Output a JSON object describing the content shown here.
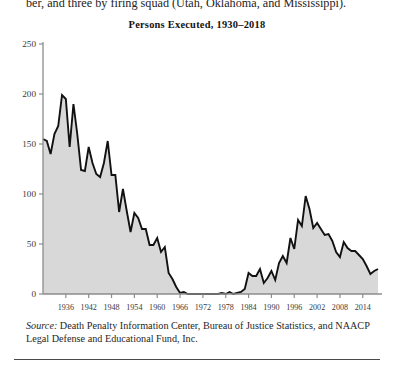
{
  "page": {
    "running_text": "ber, and three by firing squad (Utah, Oklahoma, and Mississippi).",
    "source_label": "Source:",
    "source_text": " Death Penalty Information Center, Bureau of Justice Statistics, and NAACP Legal Defense and Educational Fund, Inc."
  },
  "colors": {
    "area_fill": "#d8d8d8",
    "line": "#111111",
    "axis": "#8d8d8d",
    "text": "#1f1f1f",
    "rule": "#4a4a4a",
    "background": "#ffffff"
  },
  "chart_data": {
    "type": "area",
    "title": "Persons Executed, 1930–2018",
    "xlabel": "",
    "ylabel": "",
    "xlim": [
      1930,
      2018
    ],
    "ylim": [
      0,
      250
    ],
    "grid": false,
    "legend": null,
    "ytick_labels": [
      "0",
      "50",
      "100",
      "150",
      "200",
      "250"
    ],
    "ytick_values": [
      0,
      50,
      100,
      150,
      200,
      250
    ],
    "xtick_labels": [
      "1936",
      "1942",
      "1948",
      "1954",
      "1960",
      "1966",
      "1972",
      "1978",
      "1984",
      "1990",
      "1996",
      "2002",
      "2008",
      "2014"
    ],
    "xtick_values": [
      1936,
      1942,
      1948,
      1954,
      1960,
      1966,
      1972,
      1978,
      1984,
      1990,
      1996,
      2002,
      2008,
      2014
    ],
    "x": [
      1930,
      1931,
      1932,
      1933,
      1934,
      1935,
      1936,
      1937,
      1938,
      1939,
      1940,
      1941,
      1942,
      1943,
      1944,
      1945,
      1946,
      1947,
      1948,
      1949,
      1950,
      1951,
      1952,
      1953,
      1954,
      1955,
      1956,
      1957,
      1958,
      1959,
      1960,
      1961,
      1962,
      1963,
      1964,
      1965,
      1966,
      1967,
      1968,
      1969,
      1970,
      1971,
      1972,
      1973,
      1974,
      1975,
      1976,
      1977,
      1978,
      1979,
      1980,
      1981,
      1982,
      1983,
      1984,
      1985,
      1986,
      1987,
      1988,
      1989,
      1990,
      1991,
      1992,
      1993,
      1994,
      1995,
      1996,
      1997,
      1998,
      1999,
      2000,
      2001,
      2002,
      2003,
      2004,
      2005,
      2006,
      2007,
      2008,
      2009,
      2010,
      2011,
      2012,
      2013,
      2014,
      2015,
      2016,
      2017,
      2018
    ],
    "values": [
      155,
      153,
      140,
      160,
      168,
      199,
      195,
      147,
      190,
      160,
      124,
      123,
      147,
      131,
      120,
      117,
      131,
      153,
      119,
      119,
      82,
      105,
      83,
      62,
      81,
      76,
      65,
      65,
      49,
      49,
      56,
      42,
      47,
      21,
      15,
      7,
      1,
      2,
      0,
      0,
      0,
      0,
      0,
      0,
      0,
      0,
      0,
      1,
      0,
      2,
      0,
      1,
      2,
      5,
      21,
      18,
      18,
      25,
      11,
      16,
      23,
      14,
      31,
      38,
      31,
      56,
      45,
      74,
      68,
      98,
      85,
      66,
      71,
      65,
      59,
      60,
      53,
      42,
      37,
      52,
      46,
      43,
      43,
      39,
      35,
      28,
      20,
      23,
      25
    ],
    "series_name": "Persons executed",
    "annotations": [
      {
        "label": "moratorium",
        "x_start": 1968,
        "x_end": 1976,
        "value": 0
      }
    ]
  }
}
